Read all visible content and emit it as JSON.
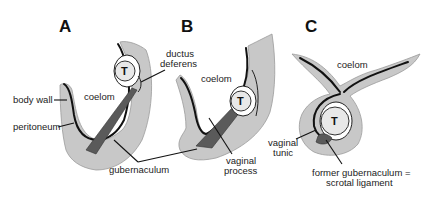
{
  "panels": [
    {
      "letter": "A",
      "testis_label": "T",
      "coelom_label": "coelom"
    },
    {
      "letter": "B",
      "testis_label": "T",
      "coelom_label": "coelom"
    },
    {
      "letter": "C",
      "testis_label": "T",
      "coelom_label": "coelom"
    }
  ],
  "labels": {
    "body_wall": "body wall",
    "peritoneum": "peritoneum",
    "ductus_line1": "ductus",
    "ductus_line2": "deferens",
    "gubernaculum": "gubernaculum",
    "vaginal_process_line1": "vaginal",
    "vaginal_process_line2": "process",
    "vaginal_tunic_line1": "vaginal",
    "vaginal_tunic_line2": "tunic",
    "former_gub_line1": "former gubernaculum =",
    "former_gub_line2": "scrotal ligament"
  }
}
